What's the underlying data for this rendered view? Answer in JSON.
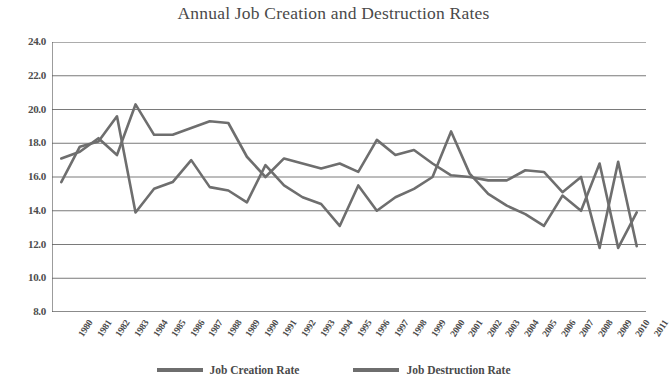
{
  "chart_data": {
    "type": "line",
    "title": "Annual Job Creation and Destruction Rates",
    "xlabel": "",
    "ylabel": "",
    "ylim": [
      8.0,
      24.0
    ],
    "ytick_step": 2.0,
    "yticks": [
      "24.0",
      "22.0",
      "20.0",
      "18.0",
      "16.0",
      "14.0",
      "12.0",
      "10.0",
      "8.0"
    ],
    "grid": true,
    "legend_position": "bottom",
    "categories": [
      "1980",
      "1981",
      "1982",
      "1983",
      "1984",
      "1985",
      "1986",
      "1987",
      "1988",
      "1989",
      "1990",
      "1991",
      "1992",
      "1993",
      "1994",
      "1995",
      "1996",
      "1997",
      "1998",
      "1999",
      "2000",
      "2001",
      "2002",
      "2003",
      "2004",
      "2005",
      "2006",
      "2007",
      "2008",
      "2009",
      "2010",
      "2011"
    ],
    "series": [
      {
        "name": "Job Creation Rate",
        "color": "#6e6e6e",
        "values": [
          17.1,
          17.5,
          18.3,
          17.3,
          20.3,
          18.5,
          18.5,
          18.9,
          19.3,
          19.2,
          17.2,
          16.0,
          17.1,
          16.8,
          16.5,
          16.8,
          16.3,
          18.2,
          17.3,
          17.6,
          16.8,
          16.1,
          16.0,
          15.8,
          15.8,
          16.4,
          16.3,
          15.1,
          16.0,
          11.8,
          16.9,
          11.9
        ]
      },
      {
        "name": "Job Destruction Rate",
        "color": "#6e6e6e",
        "values": [
          15.7,
          17.8,
          18.1,
          19.6,
          13.9,
          15.3,
          15.7,
          17.0,
          15.4,
          15.2,
          14.5,
          16.7,
          15.5,
          14.8,
          14.4,
          13.1,
          15.5,
          14.0,
          14.8,
          15.3,
          16.0,
          18.7,
          16.2,
          15.0,
          14.3,
          13.8,
          13.1,
          14.9,
          14.0,
          16.8,
          11.8,
          13.9
        ]
      }
    ]
  },
  "legend": {
    "entries": [
      {
        "label": "Job Creation Rate"
      },
      {
        "label": "Job Destruction Rate"
      }
    ]
  }
}
